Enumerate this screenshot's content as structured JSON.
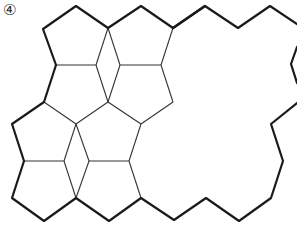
{
  "figure": {
    "label": "④"
  },
  "colors": {
    "line": "#1a1a1a",
    "inner_line": "#333333",
    "background": "#ffffff"
  },
  "outline_thick_path": "M 205 6 L 173 28 L 141 6 L 108 28 L 76 6 L 43 29 L 56 65 L 44 102 L 12 124 L 24 161 L 12 198 L 44 221 L 76 198 L 109 221 L 141 198 L 174 220 L 206 198 L 239 221 L 271 198 L 283 161 L 271 124 L 297 103",
  "outline_thick_path_top": "M 173 28 L 205 6 L 238 28 L 270 6 L 297 24",
  "outline_thick_path_right": "M 297 47 L 291 64 L 297 83",
  "inner_thin_paths": [
    "M 56 65 L 96 65",
    "M 96 65 L 108 28",
    "M 108 28 L 120 65",
    "M 120 65 L 161 65",
    "M 161 65 L 173 28",
    "M 96 65 L 108 102",
    "M 120 65 L 108 102",
    "M 161 65 L 173 102",
    "M 173 102 L 141 124",
    "M 44 102 L 76 124",
    "M 108 102 L 76 124",
    "M 108 102 L 141 124",
    "M 24 161 L 64 161",
    "M 64 161 L 76 124",
    "M 76 124 L 89 161",
    "M 89 161 L 129 161",
    "M 129 161 L 141 124",
    "M 64 161 L 76 198",
    "M 89 161 L 76 198",
    "M 129 161 L 141 198"
  ]
}
